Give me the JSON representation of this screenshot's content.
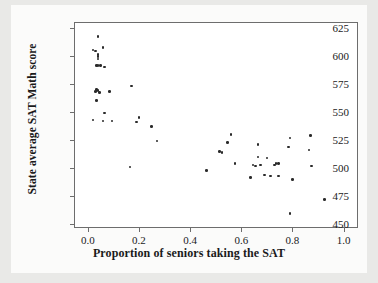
{
  "chart_data": {
    "type": "scatter",
    "title": "",
    "xlabel": "Proportion of seniors taking the SAT",
    "ylabel": "State average SAT Math score",
    "xlim": [
      -0.05,
      1.06
    ],
    "ylim": [
      446,
      629
    ],
    "xticks": [
      "0.0",
      "0.2",
      "0.4",
      "0.6",
      "0.8",
      "1.0"
    ],
    "xtick_values": [
      0.0,
      0.2,
      0.4,
      0.6,
      0.8,
      1.0
    ],
    "yticks": [
      "450",
      "475",
      "500",
      "525",
      "550",
      "575",
      "600",
      "625"
    ],
    "ytick_values": [
      450,
      475,
      500,
      525,
      550,
      575,
      600,
      625
    ],
    "grid": false,
    "legend": null,
    "marker_color": "#2a2a2a",
    "frame_color": "#6d6d6d",
    "background": "#ffffff",
    "points": [
      {
        "x": 0.04,
        "y": 617
      },
      {
        "x": 0.02,
        "y": 605
      },
      {
        "x": 0.03,
        "y": 604
      },
      {
        "x": 0.06,
        "y": 607
      },
      {
        "x": 0.04,
        "y": 601
      },
      {
        "x": 0.04,
        "y": 599
      },
      {
        "x": 0.04,
        "y": 597
      },
      {
        "x": 0.035,
        "y": 591
      },
      {
        "x": 0.04,
        "y": 591
      },
      {
        "x": 0.05,
        "y": 591
      },
      {
        "x": 0.065,
        "y": 590
      },
      {
        "x": 0.17,
        "y": 573
      },
      {
        "x": 0.035,
        "y": 570
      },
      {
        "x": 0.04,
        "y": 569
      },
      {
        "x": 0.03,
        "y": 568
      },
      {
        "x": 0.045,
        "y": 567
      },
      {
        "x": 0.085,
        "y": 568
      },
      {
        "x": 0.035,
        "y": 560
      },
      {
        "x": 0.065,
        "y": 549
      },
      {
        "x": 0.2,
        "y": 545
      },
      {
        "x": 0.02,
        "y": 543
      },
      {
        "x": 0.06,
        "y": 542
      },
      {
        "x": 0.095,
        "y": 542
      },
      {
        "x": 0.19,
        "y": 541
      },
      {
        "x": 0.25,
        "y": 537
      },
      {
        "x": 0.56,
        "y": 530
      },
      {
        "x": 0.87,
        "y": 529
      },
      {
        "x": 0.79,
        "y": 527
      },
      {
        "x": 0.27,
        "y": 524
      },
      {
        "x": 0.545,
        "y": 523
      },
      {
        "x": 0.665,
        "y": 521
      },
      {
        "x": 0.785,
        "y": 519
      },
      {
        "x": 0.865,
        "y": 516
      },
      {
        "x": 0.515,
        "y": 515
      },
      {
        "x": 0.525,
        "y": 514
      },
      {
        "x": 0.665,
        "y": 510
      },
      {
        "x": 0.7,
        "y": 509
      },
      {
        "x": 0.735,
        "y": 504
      },
      {
        "x": 0.745,
        "y": 504
      },
      {
        "x": 0.73,
        "y": 503
      },
      {
        "x": 0.675,
        "y": 503
      },
      {
        "x": 0.645,
        "y": 503
      },
      {
        "x": 0.655,
        "y": 502
      },
      {
        "x": 0.875,
        "y": 502
      },
      {
        "x": 0.575,
        "y": 504
      },
      {
        "x": 0.165,
        "y": 501
      },
      {
        "x": 0.465,
        "y": 498
      },
      {
        "x": 0.69,
        "y": 494
      },
      {
        "x": 0.715,
        "y": 493
      },
      {
        "x": 0.745,
        "y": 493
      },
      {
        "x": 0.635,
        "y": 492
      },
      {
        "x": 0.8,
        "y": 490
      },
      {
        "x": 0.925,
        "y": 472
      },
      {
        "x": 0.79,
        "y": 460
      }
    ]
  }
}
